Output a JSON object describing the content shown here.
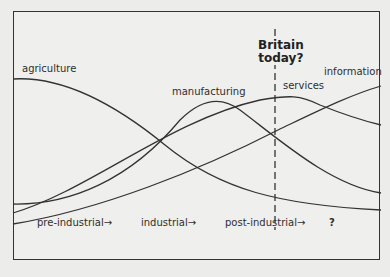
{
  "diagram": {
    "marker": {
      "line1": "Britain",
      "line2": "today?"
    },
    "curves": [
      {
        "name": "agriculture",
        "label": "agriculture"
      },
      {
        "name": "manufacturing",
        "label": "manufacturing"
      },
      {
        "name": "services",
        "label": "services"
      },
      {
        "name": "information",
        "label": "information"
      }
    ],
    "stages": [
      {
        "label": "pre-industrial→"
      },
      {
        "label": "industrial→"
      },
      {
        "label": "post-industrial→"
      },
      {
        "label": "?"
      }
    ],
    "line_color": "#333333"
  }
}
